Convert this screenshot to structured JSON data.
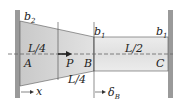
{
  "figure": {
    "type": "tapered bar fixed between two walls",
    "labels": {
      "b2": "b",
      "b2_sub": "2",
      "b1_left": "b",
      "b1_left_sub": "1",
      "b1_right": "b",
      "b1_right_sub": "1",
      "L4_top": "L/4",
      "L4_bottom": "L/4",
      "L2": "L/2",
      "A": "A",
      "P": "P",
      "B": "B",
      "C": "C",
      "x": "x",
      "delta": "δ",
      "delta_sub": "B"
    },
    "colors": {
      "wall": "#9a9a9a",
      "bar_fill": "#d9d9d9",
      "bar_fill_light": "#e9e9e9",
      "line": "#333333"
    }
  }
}
